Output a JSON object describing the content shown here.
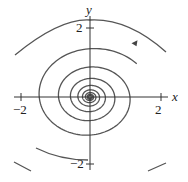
{
  "chart_data": {
    "type": "line",
    "title": "",
    "subtitle": "Phase portrait: spiral sink (counterclockwise trajectory converging to origin)",
    "xlabel": "x",
    "ylabel": "y",
    "xlim": [
      -2.5,
      2.5
    ],
    "ylim": [
      -2.5,
      2.5
    ],
    "grid": false,
    "legend": null,
    "x_ticks": [
      {
        "value": -2,
        "label": "−2"
      },
      {
        "value": 2,
        "label": "2"
      }
    ],
    "y_ticks": [
      {
        "value": 2,
        "label": "2"
      },
      {
        "value": -2,
        "label": "−2"
      }
    ],
    "series": [
      {
        "name": "trajectory",
        "kind": "spiral",
        "direction": "counterclockwise",
        "center": [
          0,
          0
        ],
        "x_semi_axis_outer": 2.3,
        "y_semi_axis_outer": 2.0,
        "decay_per_turn": 0.62,
        "turns": 8,
        "arrow_at": [
          1.3,
          1.55
        ]
      }
    ],
    "annotations": [
      {
        "type": "arrow",
        "position": [
          1.3,
          1.55
        ],
        "direction": "left"
      }
    ]
  },
  "labels": {
    "x_axis": "x",
    "y_axis": "y",
    "x_tick_neg": "−2",
    "x_tick_pos": "2",
    "y_tick_pos": "2",
    "y_tick_neg": "−2"
  },
  "colors": {
    "curve": "#555555",
    "axis": "#333333",
    "text": "#222222"
  }
}
